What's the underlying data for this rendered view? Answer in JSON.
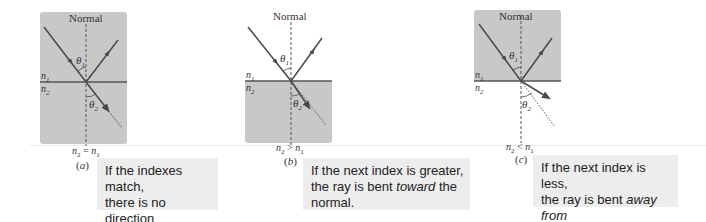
{
  "figure": {
    "colors": {
      "medium_fill": "#c8c8c8",
      "ray": "#4a4a4a",
      "interface": "#555555",
      "caption_bg": "#ededed",
      "text": "#222222"
    },
    "panels": [
      {
        "id": "a",
        "letter": "a",
        "normal_label": "Normal",
        "n1_label": "n",
        "n1_sub": "1",
        "n2_label": "n",
        "n2_sub": "2",
        "theta1_label": "θ",
        "theta1_sub": "1",
        "theta2_label": "θ",
        "theta2_sub": "2",
        "relation_lhs": "n",
        "relation_lhs_sub": "2",
        "relation_op": " = ",
        "relation_rhs": "n",
        "relation_rhs_sub": "1",
        "shaded_region": "both",
        "caption_lines": [
          "If the indexes match,",
          "there is no direction",
          "change."
        ]
      },
      {
        "id": "b",
        "letter": "b",
        "normal_label": "Normal",
        "n1_label": "n",
        "n1_sub": "1",
        "n2_label": "n",
        "n2_sub": "2",
        "theta1_label": "θ",
        "theta1_sub": "1",
        "theta2_label": "θ",
        "theta2_sub": "2",
        "relation_lhs": "n",
        "relation_lhs_sub": "2",
        "relation_op": " > ",
        "relation_rhs": "n",
        "relation_rhs_sub": "1",
        "shaded_region": "bottom",
        "caption_line1": "If the next index is greater,",
        "caption_line2_pre": "the ray is bent ",
        "caption_line2_em": "toward",
        "caption_line2_post": " the",
        "caption_line3": "normal."
      },
      {
        "id": "c",
        "letter": "c",
        "normal_label": "Normal",
        "n1_label": "n",
        "n1_sub": "1",
        "n2_label": "n",
        "n2_sub": "2",
        "theta1_label": "θ",
        "theta1_sub": "1",
        "theta2_label": "θ",
        "theta2_sub": "2",
        "relation_lhs": "n",
        "relation_lhs_sub": "2",
        "relation_op": " < ",
        "relation_rhs": "n",
        "relation_rhs_sub": "1",
        "shaded_region": "top",
        "caption_line1": "If the next index is less,",
        "caption_line2_pre": "the ray is bent ",
        "caption_line2_em": "away from",
        "caption_line3": "the normal."
      }
    ]
  }
}
